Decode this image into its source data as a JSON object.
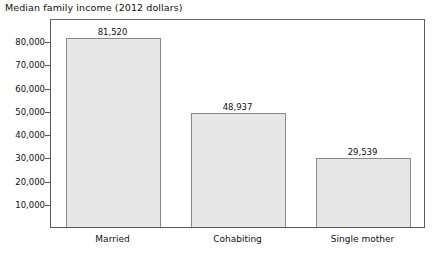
{
  "chart_data": {
    "type": "bar",
    "title": "Median family income (2012 dollars)",
    "xlabel": "",
    "ylabel": "",
    "categories": [
      "Married",
      "Cohabiting",
      "Single mother"
    ],
    "values": [
      81520,
      48937,
      29539
    ],
    "value_labels": [
      "81,520",
      "48,937",
      "29,539"
    ],
    "ylim": [
      0,
      90000
    ],
    "yticks": [
      10000,
      20000,
      30000,
      40000,
      50000,
      60000,
      70000,
      80000
    ],
    "ytick_labels": [
      "10,000",
      "20,000",
      "30,000",
      "40,000",
      "50,000",
      "60,000",
      "70,000",
      "80,000"
    ],
    "grid": false,
    "legend": false,
    "bar_fill_color": "#e7e7e7",
    "bar_border_color": "#8a8a8a",
    "axis_color": "#5a5a5a",
    "text_color": "#111111"
  }
}
